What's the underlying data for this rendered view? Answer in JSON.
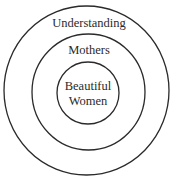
{
  "diagram": {
    "type": "concentric-circles",
    "rings": [
      {
        "label": "Understanding",
        "level": "outer"
      },
      {
        "label": "Mothers",
        "level": "middle"
      },
      {
        "label_line1": "Beautiful",
        "label_line2": "Women",
        "level": "inner"
      }
    ],
    "colors": {
      "stroke": "#2a2a2a",
      "background": "#ffffff"
    }
  }
}
